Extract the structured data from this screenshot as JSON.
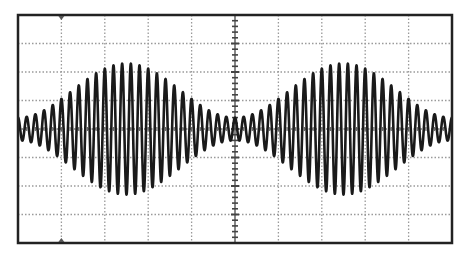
{
  "chart_data": {
    "type": "line",
    "title": "",
    "subtitle": "",
    "xlabel": "",
    "ylabel": "",
    "grid": {
      "on": true,
      "style": "dotted",
      "horizontal_divisions": 10,
      "vertical_divisions": 8,
      "center_axes_with_minor_ticks": true,
      "minor_ticks_per_division": 5
    },
    "xlim": [
      0,
      10
    ],
    "ylim": [
      -4,
      4
    ],
    "units": "divisions",
    "series": [
      {
        "name": "AM signal",
        "modulation": "amplitude",
        "carrier_cycles_across_screen": 50,
        "envelope_cycles_across_screen": 2,
        "envelope_period_div": 5,
        "envelope_max_amplitude_div": 2.3,
        "envelope_min_amplitude_div": 0.4,
        "modulation_index": 0.7,
        "envelope_peaks_at_div": [
          2.5,
          7.5
        ],
        "envelope_minima_at_div": [
          0,
          5,
          10
        ],
        "color": "#1a1a1a"
      }
    ],
    "markers": {
      "trigger_top": "triangle at x=1 div",
      "trigger_bottom": "triangle at x=1 div"
    },
    "legend": null
  },
  "colors": {
    "background": "#ffffff",
    "frame": "#222222",
    "grid": "#9a9a9a",
    "trace": "#1a1a1a"
  }
}
